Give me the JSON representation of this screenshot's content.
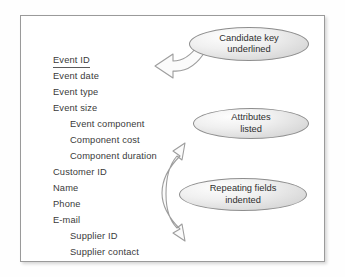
{
  "figure": {
    "frame": {
      "border_color": "#9a9a9a",
      "background_color": "#ffffff"
    },
    "attribute_list": [
      {
        "label": "Event ID",
        "indented": false,
        "underlined": true
      },
      {
        "label": "Event date",
        "indented": false,
        "underlined": false
      },
      {
        "label": "Event type",
        "indented": false,
        "underlined": false
      },
      {
        "label": "Event size",
        "indented": false,
        "underlined": false
      },
      {
        "label": "Event component",
        "indented": true,
        "underlined": false
      },
      {
        "label": "Component cost",
        "indented": true,
        "underlined": false
      },
      {
        "label": "Component duration",
        "indented": true,
        "underlined": false
      },
      {
        "label": "Customer ID",
        "indented": false,
        "underlined": false
      },
      {
        "label": "Name",
        "indented": false,
        "underlined": false
      },
      {
        "label": "Phone",
        "indented": false,
        "underlined": false
      },
      {
        "label": "E-mail",
        "indented": false,
        "underlined": false
      },
      {
        "label": "Supplier ID",
        "indented": true,
        "underlined": false
      },
      {
        "label": "Supplier contact",
        "indented": true,
        "underlined": false
      }
    ],
    "callouts": [
      {
        "line1": "Candidate key",
        "line2": "underlined"
      },
      {
        "line1": "Attributes",
        "line2": "listed"
      },
      {
        "line1": "Repeating fields",
        "line2": "indented"
      }
    ],
    "arrows": [
      {
        "name": "candidate-key-arrow",
        "heads": 1,
        "points_to": "Event ID"
      },
      {
        "name": "repeating-fields-arrow",
        "heads": 2,
        "points_to": "Component duration and Supplier ID"
      }
    ],
    "colors": {
      "text": "#3a3a3a",
      "ellipse_outline": "#8e8e8e",
      "ellipse_fill_light": "#fdfdfd",
      "ellipse_fill_dark": "#cbcbcb",
      "arrow_outline": "#9d9d9d",
      "arrow_fill": "#fbfbfb"
    }
  }
}
